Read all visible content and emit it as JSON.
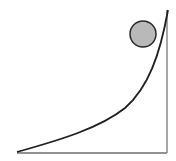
{
  "diagram": {
    "title": "Ball on curved ramp",
    "ramp": {
      "curve_color": "#1e1e1e",
      "base_color": "#6e6e6e",
      "wall_color": "#8a8a8a",
      "base_start": [
        17,
        153
      ],
      "corner": [
        167,
        153
      ],
      "wall_top": [
        167,
        10
      ],
      "curve_path": "M17,152 C60,140 100,128 125,108 C148,88 160,55 168,10"
    },
    "ball": {
      "cx": 143,
      "cy": 34,
      "r": 13,
      "fill": "#b9b9b9",
      "stroke": "#2a2a2a"
    }
  }
}
